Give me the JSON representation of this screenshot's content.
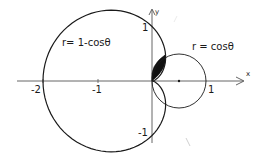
{
  "chart_data": {
    "type": "line",
    "title": "",
    "coordinate_system": "polar curves on Cartesian axes",
    "xlabel": "x",
    "ylabel": "y",
    "xlim": [
      -2.3,
      1.8
    ],
    "ylim": [
      -1.3,
      1.3
    ],
    "x_ticks": [
      "-2",
      "-1",
      "1"
    ],
    "y_ticks": [
      "1",
      "-1"
    ],
    "grid": false,
    "series": [
      {
        "name": "r = 1 - cos θ",
        "label": "r= 1-cosθ",
        "kind": "cardioid",
        "key_points": [
          [
            -2,
            0
          ],
          [
            0,
            1
          ],
          [
            0,
            -1
          ],
          [
            0,
            0
          ]
        ]
      },
      {
        "name": "r = cos θ",
        "label": "r = cosθ",
        "kind": "circle",
        "center": [
          0.5,
          0
        ],
        "radius": 0.5,
        "key_points": [
          [
            1,
            0
          ],
          [
            0,
            0
          ]
        ]
      }
    ],
    "annotations": [
      {
        "type": "shaded_region",
        "description": "region inside both curves, upper half plane, between origin and intersection at θ=π/3 (x=0.25, y≈0.433)"
      },
      {
        "type": "point",
        "at": [
          0.5,
          0
        ],
        "description": "center dot of circle"
      }
    ]
  },
  "labels": {
    "cardioid_eq": "r= 1-cosθ",
    "circle_eq": "r = cosθ",
    "x_axis": "x",
    "y_axis": "y",
    "tick_neg2": "-2",
    "tick_neg1": "-1",
    "tick_pos1_x": "1",
    "tick_pos1_y": "1",
    "tick_neg1_y": "-1"
  },
  "colors": {
    "ink": "#1a1a1a",
    "axis": "#555555",
    "background": "#ffffff"
  }
}
